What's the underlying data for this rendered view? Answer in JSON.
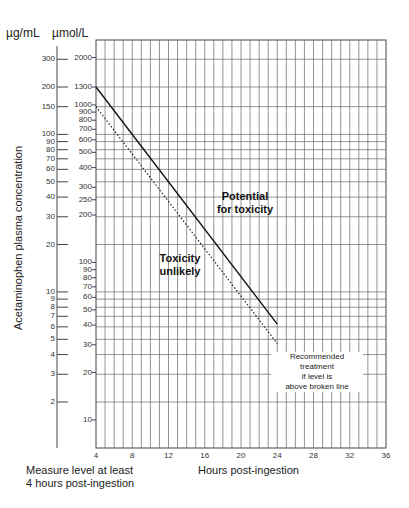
{
  "units": {
    "left": "µg/mL",
    "right": "µmol/L"
  },
  "y_axis_label": "Acetaminophen plasma concentration",
  "x_axis_label": "Hours post-ingestion",
  "footnote": {
    "line1": "Measure level at least",
    "line2": "4 hours post-ingestion"
  },
  "annotations": {
    "above_line_1": "Potential",
    "above_line_2": "for toxicity",
    "below_line_1": "Toxicity",
    "below_line_2": "unlikely",
    "treatment_1": "Recommended treatment",
    "treatment_2": "if level is",
    "treatment_3": "above broken line"
  },
  "x_ticks": [
    "4",
    "8",
    "12",
    "16",
    "20",
    "24",
    "28",
    "32",
    "36"
  ],
  "ug_ticks": [
    "300",
    "200",
    "150",
    "100",
    "90",
    "80",
    "70",
    "60",
    "50",
    "40",
    "30",
    "20",
    "10",
    "9",
    "8",
    "7",
    "6",
    "5",
    "4",
    "3",
    "2"
  ],
  "umol_ticks": [
    "2000",
    "1300",
    "1000",
    "900",
    "800",
    "700",
    "600",
    "500",
    "400",
    "300",
    "250",
    "200",
    "100",
    "90",
    "80",
    "70",
    "60",
    "50",
    "40",
    "30",
    "20",
    "10"
  ],
  "chart_data": {
    "type": "line",
    "xlabel": "Hours post-ingestion",
    "ylabel": "Acetaminophen plasma concentration",
    "y_scale": "log",
    "x_range": [
      4,
      36
    ],
    "y_range_ug_per_mL": [
      1,
      400
    ],
    "x_ticks": [
      4,
      8,
      12,
      16,
      20,
      24,
      28,
      32,
      36
    ],
    "y_ticks_ug_per_mL": [
      2,
      3,
      4,
      5,
      6,
      7,
      8,
      9,
      10,
      20,
      30,
      40,
      50,
      60,
      70,
      80,
      90,
      100,
      150,
      200,
      300
    ],
    "y_ticks_umol_per_L": [
      10,
      20,
      30,
      40,
      50,
      60,
      70,
      80,
      90,
      100,
      200,
      250,
      300,
      400,
      500,
      600,
      700,
      800,
      900,
      1000,
      1300,
      2000
    ],
    "grid": true,
    "series": [
      {
        "name": "Probable toxicity line (solid)",
        "style": "solid",
        "x": [
          4,
          24
        ],
        "y_ug_per_mL": [
          200,
          6.25
        ],
        "y_umol_per_L": [
          1300,
          40
        ]
      },
      {
        "name": "Treatment line (broken)",
        "style": "dotted",
        "x": [
          4,
          24
        ],
        "y_ug_per_mL": [
          150,
          4.7
        ],
        "y_umol_per_L": [
          1000,
          30
        ]
      }
    ],
    "annotations": [
      "Potential for toxicity",
      "Toxicity unlikely",
      "Recommended treatment if level is above broken line",
      "Measure level at least 4 hours post-ingestion"
    ]
  }
}
